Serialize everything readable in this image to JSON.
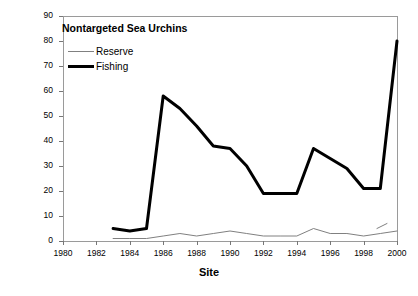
{
  "chart_data": {
    "type": "line",
    "title": "Nontargeted Sea Urchins",
    "xlabel": "Site",
    "ylabel": "Number Per Sq. Meter",
    "xlim": [
      1980,
      2000
    ],
    "ylim": [
      0,
      90
    ],
    "xticks": [
      1980,
      1982,
      1984,
      1986,
      1988,
      1990,
      1992,
      1994,
      1996,
      1998,
      2000
    ],
    "yticks": [
      0,
      10,
      20,
      30,
      40,
      50,
      60,
      70,
      80,
      90
    ],
    "grid": false,
    "legend_position": "top-left",
    "series": [
      {
        "name": "Reserve",
        "color": "#808080",
        "linewidth": 1,
        "x": [
          1983,
          1984,
          1985,
          1986,
          1987,
          1988,
          1989,
          1990,
          1991,
          1992,
          1993,
          1994,
          1995,
          1996,
          1997,
          1998,
          1999,
          2000
        ],
        "values": [
          1,
          1,
          1,
          2,
          3,
          2,
          3,
          4,
          3,
          2,
          2,
          2,
          5,
          3,
          3,
          2,
          3,
          4
        ]
      },
      {
        "name": "Fishing",
        "color": "#000000",
        "linewidth": 3,
        "x": [
          1983,
          1984,
          1985,
          1986,
          1987,
          1988,
          1989,
          1990,
          1991,
          1992,
          1993,
          1994,
          1995,
          1996,
          1997,
          1998,
          1999,
          2000
        ],
        "values": [
          5,
          4,
          5,
          58,
          53,
          46,
          38,
          37,
          30,
          19,
          19,
          19,
          37,
          33,
          29,
          21,
          21,
          80
        ]
      }
    ],
    "segments": [
      {
        "name": "Reserve",
        "note": "detached short segment near 1999",
        "x": [
          1998.8,
          1999.4
        ],
        "values": [
          5,
          7
        ]
      }
    ]
  },
  "axes": {
    "y_tick_labels": [
      "90",
      "80",
      "70",
      "60",
      "50",
      "40",
      "30",
      "20",
      "10",
      "0"
    ],
    "x_tick_labels": [
      "1980",
      "1982",
      "1984",
      "1986",
      "1988",
      "1990",
      "1992",
      "1994",
      "1996",
      "1998",
      "2000"
    ]
  },
  "legend": {
    "items": [
      {
        "label": "Reserve",
        "style": "thin"
      },
      {
        "label": "Fishing",
        "style": "thick"
      }
    ]
  }
}
